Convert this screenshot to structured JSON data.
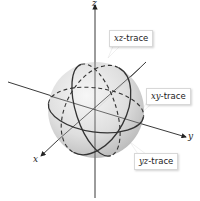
{
  "figure": {
    "axes": {
      "x_label": "x",
      "y_label": "y",
      "z_label": "z"
    },
    "callouts": [
      {
        "id": "xz",
        "var": "xz",
        "suffix": "-trace"
      },
      {
        "id": "xy",
        "var": "xy",
        "suffix": "-trace"
      },
      {
        "id": "yz",
        "var": "yz",
        "suffix": "-trace"
      }
    ],
    "colors": {
      "sphere_fill_light": "#f4f4f4",
      "sphere_fill_dark": "#b8b8b8",
      "trace_stroke": "#333333",
      "axis_stroke": "#222222",
      "callout_border": "#d8d8d8"
    }
  }
}
